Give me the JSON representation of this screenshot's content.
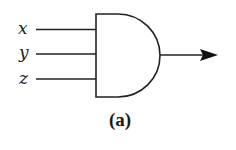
{
  "diagram": {
    "type": "logic-gate",
    "gate": "AND",
    "inputs": [
      {
        "label": "x"
      },
      {
        "label": "y"
      },
      {
        "label": "z"
      }
    ],
    "output": {
      "direction": "right",
      "arrow": true
    },
    "caption": "(a)",
    "colors": {
      "stroke": "#222222",
      "background": "#ffffff"
    }
  }
}
